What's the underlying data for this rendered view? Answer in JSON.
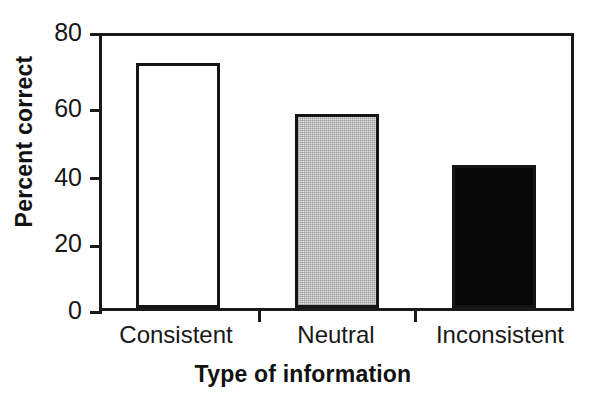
{
  "chart_data": {
    "type": "bar",
    "title": "",
    "subtitle": "",
    "categories": [
      "Consistent",
      "Neutral",
      "Inconsistent"
    ],
    "values": [
      72,
      57,
      42
    ],
    "series": [
      {
        "name": "Percent correct",
        "values": [
          72,
          57,
          42
        ]
      }
    ],
    "xlabel": "Type of information",
    "ylabel": "Percent correct",
    "ylim": [
      0,
      80
    ],
    "yticks": [
      0,
      20,
      40,
      60,
      80
    ],
    "ytick_labels": [
      "0",
      "20",
      "40",
      "60",
      "80"
    ],
    "grid": false,
    "legend": false,
    "legend_position": "none",
    "bar_styles": [
      {
        "category": "Consistent",
        "fill": "#ffffff",
        "edge": "#151515",
        "pattern": "solid-white"
      },
      {
        "category": "Neutral",
        "fill": "#e2e2e2",
        "edge": "#151515",
        "pattern": "stipple-gray"
      },
      {
        "category": "Inconsistent",
        "fill": "#080808",
        "edge": "#151515",
        "pattern": "solid-black"
      }
    ],
    "annotations": []
  },
  "axes": {
    "y_ticks": [
      {
        "label": "80",
        "value": 80
      },
      {
        "label": "60",
        "value": 60
      },
      {
        "label": "40",
        "value": 40
      },
      {
        "label": "20",
        "value": 20
      },
      {
        "label": "0",
        "value": 0
      }
    ],
    "x_categories": [
      {
        "label": "Consistent"
      },
      {
        "label": "Neutral"
      },
      {
        "label": "Inconsistent"
      }
    ]
  },
  "titles": {
    "x_axis": "Type of information",
    "y_axis": "Percent correct"
  },
  "colors": {
    "axis": "#1a1a1a",
    "text": "#181818",
    "bar_white": "#ffffff",
    "bar_gray": "#e2e2e2",
    "bar_black": "#080808",
    "background": "#ffffff"
  }
}
